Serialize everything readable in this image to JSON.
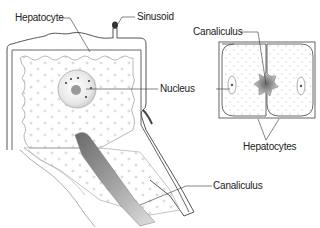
{
  "diagram": {
    "main_view": {
      "labels": {
        "hepatocyte": "Hepatocyte",
        "sinusoid": "Sinusoid",
        "nucleus": "Nucleus",
        "canaliculus": "Canaliculus"
      }
    },
    "inset_view": {
      "labels": {
        "canaliculus": "Canaliculus",
        "hepatocytes": "Hepatocytes"
      }
    },
    "colors": {
      "outline": "#555555",
      "cytoplasm": "#f7f7f7",
      "dots": "#bbbbbb",
      "canal_dark": "#777777",
      "text": "#222222"
    }
  }
}
